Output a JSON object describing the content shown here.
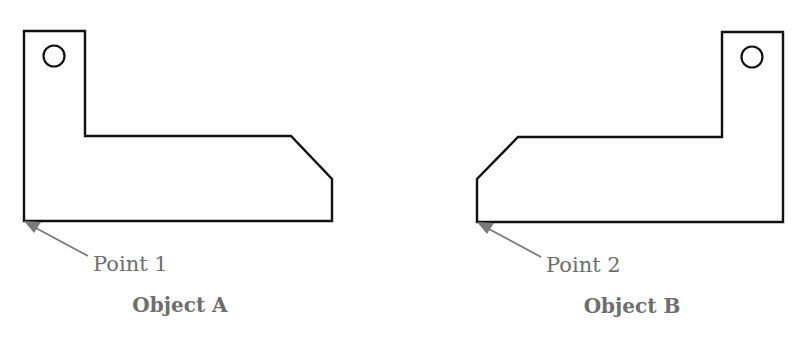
{
  "diagram": {
    "object_a": {
      "label": "Object A",
      "point_label": "Point 1"
    },
    "object_b": {
      "label": "Object B",
      "point_label": "Point 2"
    }
  },
  "colors": {
    "outline": "#111111",
    "annotation": "#7a7a7a",
    "label_text": "#6e6e6e",
    "background": "#ffffff"
  }
}
